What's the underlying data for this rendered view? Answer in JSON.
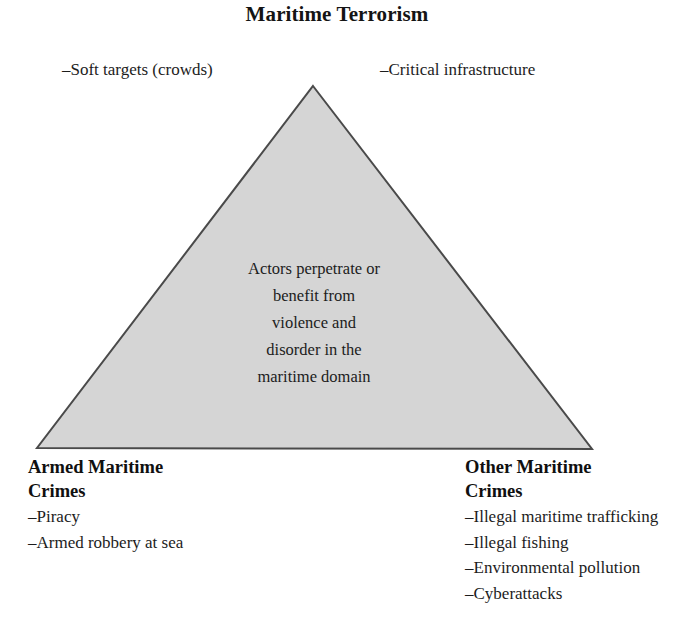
{
  "title": "Maritime Terrorism",
  "apex_labels": {
    "left": "–Soft targets (crowds)",
    "right": "–Critical infrastructure"
  },
  "core_statement": {
    "lines": [
      "Actors perpetrate or",
      "benefit from",
      "violence and",
      "disorder in the",
      "maritime domain"
    ]
  },
  "corners": {
    "bottom_left": {
      "heading_lines": [
        "Armed Maritime",
        "Crimes"
      ],
      "items": [
        "–Piracy",
        "–Armed robbery at sea"
      ]
    },
    "bottom_right": {
      "heading_lines": [
        "Other Maritime",
        "Crimes"
      ],
      "items": [
        "–Illegal maritime trafficking",
        "–Illegal fishing",
        "–Environmental pollution",
        "–Cyberattacks"
      ]
    }
  },
  "shape": {
    "name": "triangle",
    "fill_color": "#d5d5d5",
    "stroke_color": "#4a4a4a",
    "stroke_width": 2,
    "points": "313,86 592,449 37,448"
  }
}
